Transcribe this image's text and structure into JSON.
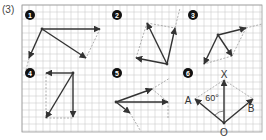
{
  "problem_label": "(3)",
  "grid": {
    "x0": 22,
    "y0": 5,
    "x1": 262,
    "y1": 132,
    "step": 7,
    "line_color": "#cfcfcf",
    "border_color": "#999999"
  },
  "colors": {
    "vector": "#333333",
    "dashed": "#9a9a9a",
    "badge": "#111111",
    "badge_text": "#ffffff"
  },
  "badges": [
    {
      "id": "1",
      "label": "1",
      "x": 30,
      "y": 15
    },
    {
      "id": "2",
      "label": "2",
      "x": 117,
      "y": 15
    },
    {
      "id": "3",
      "label": "3",
      "x": 193,
      "y": 15
    },
    {
      "id": "4",
      "label": "4",
      "x": 30,
      "y": 73
    },
    {
      "id": "5",
      "label": "5",
      "x": 117,
      "y": 73
    },
    {
      "id": "6",
      "label": "6",
      "x": 188,
      "y": 73
    }
  ],
  "figures": [
    {
      "id": "1",
      "vectors": [
        [
          42,
          29,
          100,
          29
        ],
        [
          42,
          29,
          29,
          58
        ],
        [
          42,
          29,
          86,
          58
        ]
      ],
      "dashed": [
        [
          100,
          29,
          86,
          58
        ],
        [
          29,
          58,
          26,
          70
        ]
      ]
    },
    {
      "id": "2",
      "vectors": [
        [
          167,
          64,
          147,
          23
        ],
        [
          167,
          64,
          175,
          28
        ],
        [
          167,
          64,
          136,
          58
        ]
      ],
      "dashed": [
        [
          147,
          23,
          175,
          28
        ],
        [
          136,
          58,
          147,
          23
        ],
        [
          175,
          28,
          180,
          8
        ]
      ]
    },
    {
      "id": "3",
      "vectors": [
        [
          218,
          35,
          246,
          28
        ],
        [
          218,
          35,
          232,
          56
        ],
        [
          218,
          35,
          204,
          64
        ]
      ],
      "dashed": [
        [
          246,
          28,
          262,
          24
        ],
        [
          246,
          28,
          232,
          56
        ],
        [
          232,
          56,
          204,
          64
        ]
      ]
    },
    {
      "id": "4",
      "vectors": [
        [
          73,
          73,
          46,
          118
        ],
        [
          73,
          73,
          73,
          117
        ],
        [
          73,
          73,
          46,
          73
        ]
      ],
      "dashed": [
        [
          46,
          73,
          46,
          118
        ],
        [
          46,
          118,
          73,
          118
        ]
      ]
    },
    {
      "id": "5",
      "vectors": [
        [
          116,
          102,
          152,
          89
        ],
        [
          116,
          102,
          168,
          102
        ],
        [
          116,
          102,
          130,
          113
        ]
      ],
      "dashed": [
        [
          152,
          89,
          168,
          102
        ],
        [
          168,
          102,
          168,
          118
        ],
        [
          130,
          113,
          140,
          130
        ],
        [
          152,
          89,
          170,
          78
        ]
      ]
    },
    {
      "id": "6",
      "vectors": [
        [
          224,
          123,
          224,
          80
        ],
        [
          224,
          123,
          195,
          99
        ],
        [
          224,
          123,
          253,
          99
        ]
      ],
      "dashed": [
        [
          195,
          99,
          224,
          80
        ],
        [
          224,
          80,
          253,
          99
        ]
      ]
    }
  ],
  "figure6_labels": {
    "x_label": "X",
    "x_pos": [
      224,
      78
    ],
    "a_label": "A",
    "a_pos": [
      188,
      104
    ],
    "b_label": "B",
    "b_pos": [
      251,
      112
    ],
    "o_label": "O",
    "o_pos": [
      224,
      136
    ],
    "angle_label": "60°",
    "angle_pos": [
      212,
      101
    ]
  }
}
